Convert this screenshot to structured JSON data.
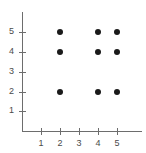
{
  "chart_data": {
    "type": "scatter",
    "title": "",
    "xlabel": "",
    "ylabel": "",
    "xlim": [
      0,
      6
    ],
    "ylim": [
      0,
      6
    ],
    "grid": false,
    "legend": null,
    "x_ticks": [
      1,
      2,
      3,
      4,
      5
    ],
    "y_ticks": [
      1,
      2,
      3,
      4,
      5
    ],
    "x_tick_labels": [
      "1",
      "2",
      "3",
      "4",
      "5"
    ],
    "y_tick_labels": [
      "1",
      "2",
      "3",
      "4",
      "5"
    ],
    "point_color": "#1a1a1a",
    "axis_color": "#6d6d6d",
    "points": [
      {
        "x": 2,
        "y": 5
      },
      {
        "x": 4,
        "y": 5
      },
      {
        "x": 5,
        "y": 5
      },
      {
        "x": 2,
        "y": 4
      },
      {
        "x": 4,
        "y": 4
      },
      {
        "x": 5,
        "y": 4
      },
      {
        "x": 2,
        "y": 2
      },
      {
        "x": 4,
        "y": 2
      },
      {
        "x": 5,
        "y": 2
      }
    ]
  },
  "axes": {
    "origin_px": {
      "x": 22,
      "y": 131
    },
    "unit_px": {
      "x": 19,
      "y": 19.75
    }
  }
}
